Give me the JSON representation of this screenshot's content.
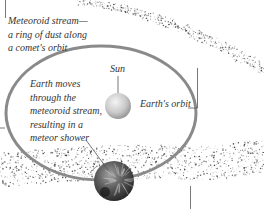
{
  "diagram": {
    "colors": {
      "background": "#ffffff",
      "orbit": "#8a8a8a",
      "sun_light": "#e8e8e8",
      "sun_dark": "#9a9a9a",
      "earth_light": "#8c8c8c",
      "earth_dark": "#1e1e1e",
      "dust": "#3a3a3a",
      "text": "#333333",
      "leader": "#555555"
    },
    "labels": {
      "stream": {
        "lines": [
          "Meteoroid stream—",
          "a ring of dust along",
          "a comet's orbit"
        ]
      },
      "sun": "Sun",
      "earth_orbit": "Earth's orbit",
      "earth_note": {
        "lines": [
          "Earth moves",
          "through the",
          "meteoroid stream,",
          "resulting in a",
          "meteor shower"
        ]
      }
    },
    "objects": [
      {
        "name": "sun",
        "shape": "sphere"
      },
      {
        "name": "earth",
        "shape": "sphere"
      },
      {
        "name": "earth-orbit",
        "shape": "ellipse"
      },
      {
        "name": "meteoroid-stream",
        "shape": "dust-band"
      }
    ]
  }
}
